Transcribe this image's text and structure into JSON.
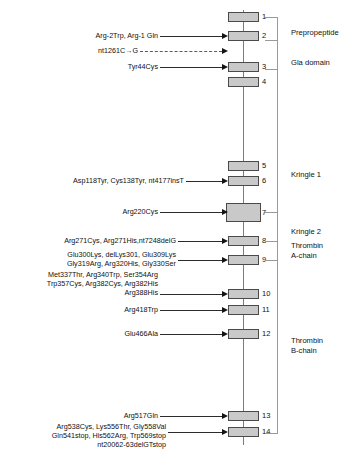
{
  "figure": {
    "type": "gene-exon-mutation-map",
    "backbone": {
      "x": 243,
      "y_top": 10,
      "y_bottom": 445
    }
  },
  "exons": [
    {
      "number": "1",
      "x": 228,
      "y": 12,
      "w": 31,
      "h": 10
    },
    {
      "number": "2",
      "x": 228,
      "y": 31,
      "w": 31,
      "h": 10
    },
    {
      "number": "3",
      "x": 228,
      "y": 62,
      "w": 31,
      "h": 10
    },
    {
      "number": "4",
      "x": 228,
      "y": 77,
      "w": 31,
      "h": 10
    },
    {
      "number": "5",
      "x": 228,
      "y": 161,
      "w": 31,
      "h": 10
    },
    {
      "number": "6",
      "x": 228,
      "y": 176,
      "w": 31,
      "h": 10
    },
    {
      "number": "7",
      "x": 226,
      "y": 203,
      "w": 35,
      "h": 19
    },
    {
      "number": "8",
      "x": 228,
      "y": 236,
      "w": 31,
      "h": 10
    },
    {
      "number": "9",
      "x": 228,
      "y": 255,
      "w": 31,
      "h": 10
    },
    {
      "number": "10",
      "x": 228,
      "y": 289,
      "w": 31,
      "h": 10
    },
    {
      "number": "11",
      "x": 228,
      "y": 305,
      "w": 31,
      "h": 10
    },
    {
      "number": "12",
      "x": 228,
      "y": 329,
      "w": 31,
      "h": 10
    },
    {
      "number": "13",
      "x": 228,
      "y": 411,
      "w": 31,
      "h": 10
    },
    {
      "number": "14",
      "x": 228,
      "y": 427,
      "w": 31,
      "h": 10
    }
  ],
  "mutation_labels": [
    {
      "id": "exon2-mutations",
      "text": "Arg-2Trp, Arg-1 Gln",
      "target_exon": "2",
      "leader": {
        "x": 160,
        "y": 36,
        "w": 62,
        "style": "solid"
      },
      "label_right": 158,
      "label_top": 31
    },
    {
      "id": "intron-nt1261",
      "text": "nt1261C→G",
      "target_exon": "intron 2-3",
      "leader": {
        "x": 140,
        "y": 51,
        "w": 82,
        "style": "dashed"
      },
      "label_right": 138,
      "label_top": 46
    },
    {
      "id": "exon3-mutations",
      "text": "Tyr44Cys",
      "target_exon": "3",
      "leader": {
        "x": 160,
        "y": 67,
        "w": 62,
        "style": "solid"
      },
      "label_right": 158,
      "label_top": 62
    },
    {
      "id": "exon6-mutations",
      "text": "Asp118Tyr, Cys138Tyr, nt4177insT",
      "target_exon": "6",
      "leader": {
        "x": 186,
        "y": 181,
        "w": 36,
        "style": "solid"
      },
      "label_right": 184,
      "label_top": 176
    },
    {
      "id": "exon7-mutations",
      "text": "Arg220Cys",
      "target_exon": "7",
      "leader": {
        "x": 160,
        "y": 212,
        "w": 62,
        "style": "solid"
      },
      "label_right": 158,
      "label_top": 207
    },
    {
      "id": "exon8-mutations",
      "text": "Arg271Cys, Arg271His,nt7248delG",
      "target_exon": "8",
      "leader": {
        "x": 178,
        "y": 241,
        "w": 44,
        "style": "solid"
      },
      "label_right": 176,
      "label_top": 236
    },
    {
      "id": "exon9-mutations",
      "text": "Glu300Lys, delLys301, Glu309Lys\nGly319Arg, Arg320His, Gly330Ser",
      "target_exon": "9",
      "leader": {
        "x": 178,
        "y": 260,
        "w": 44,
        "style": "solid"
      },
      "label_right": 176,
      "label_top": 250
    },
    {
      "id": "exon10-mutations",
      "text": "Met337Thr, Arg340Trp, Ser354Arg\nTrp357Cys, Arg382Cys, Arg382His\nArg388His",
      "target_exon": "10",
      "leader": {
        "x": 160,
        "y": 294,
        "w": 62,
        "style": "solid"
      },
      "label_right": 158,
      "label_top": 270
    },
    {
      "id": "exon11-mutations",
      "text": "Arg418Trp",
      "target_exon": "11",
      "leader": {
        "x": 160,
        "y": 310,
        "w": 62,
        "style": "solid"
      },
      "label_right": 158,
      "label_top": 305
    },
    {
      "id": "exon12-mutations",
      "text": "Glu466Ala",
      "target_exon": "12",
      "leader": {
        "x": 160,
        "y": 334,
        "w": 62,
        "style": "solid"
      },
      "label_right": 158,
      "label_top": 329
    },
    {
      "id": "exon13-mutations",
      "text": "Arg517Gln",
      "target_exon": "13",
      "leader": {
        "x": 160,
        "y": 416,
        "w": 62,
        "style": "solid"
      },
      "label_right": 158,
      "label_top": 411
    },
    {
      "id": "exon14-mutations",
      "text": "Arg538Cys, Lys556Thr, Gly558Val\nGln541stop, His562Arg, Trp569stop\nnt20062-63delGTstop",
      "target_exon": "14",
      "leader": {
        "x": 168,
        "y": 432,
        "w": 54,
        "style": "solid"
      },
      "label_right": 166,
      "label_top": 422
    }
  ],
  "domains": [
    {
      "name": "Prepropeptide",
      "label_top": 28,
      "tick_top": 17,
      "tick_bottom": 40
    },
    {
      "name": "Gla domain",
      "label_top": 58,
      "tick_top": 40,
      "tick_bottom": 69
    },
    {
      "name": "Kringle 1",
      "label_top": 170,
      "tick_top": 69,
      "tick_bottom": 212
    },
    {
      "name": "Kringle 2",
      "label_top": 227,
      "tick_top": 212,
      "tick_bottom": 241
    },
    {
      "name": "Thrombin\nA-chain",
      "label_top": 241,
      "tick_top": 241,
      "tick_bottom": 260
    },
    {
      "name": "Thrombin\nB-chain",
      "label_top": 336,
      "tick_top": 260,
      "tick_bottom": 433
    }
  ]
}
